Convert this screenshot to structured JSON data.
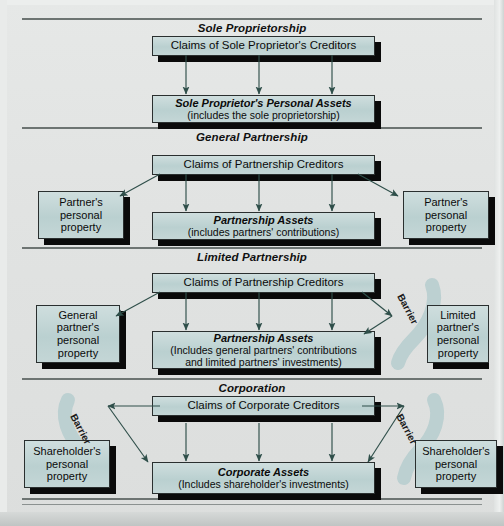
{
  "figure": {
    "title_style": "bold-italic",
    "colors": {
      "box_fill": "#bfd2d2",
      "box_border": "#2a2f2f",
      "shadow": "#0a0a0a",
      "rule": "#6d7472",
      "arrow": "#2f4f4a",
      "barrier_fill": "#b9cfd0",
      "page_background": "#e2e4e3"
    }
  },
  "sections": [
    {
      "id": "sole-proprietorship",
      "title": "Sole Proprietorship",
      "top_box": "Claims of Sole Proprietor's Creditors",
      "bottom_box": {
        "line1": "Sole Proprietor's Personal Assets",
        "line2": "(includes the sole proprietorship)"
      },
      "arrow_count": 3,
      "side_boxes": [],
      "barriers": []
    },
    {
      "id": "general-partnership",
      "title": "General Partnership",
      "top_box": "Claims of Partnership Creditors",
      "bottom_box": {
        "line1": "Partnership Assets",
        "line2": "(includes partners' contributions)"
      },
      "arrow_count": 3,
      "side_boxes": [
        {
          "position": "left",
          "lines": [
            "Partner's",
            "personal",
            "property"
          ]
        },
        {
          "position": "right",
          "lines": [
            "Partner's",
            "personal",
            "property"
          ]
        }
      ],
      "barriers": []
    },
    {
      "id": "limited-partnership",
      "title": "Limited Partnership",
      "top_box": "Claims of Partnership Creditors",
      "bottom_box": {
        "line1": "Partnership Assets",
        "line2": "(Includes general partners' contributions",
        "line3": "and limited partners' investments)"
      },
      "arrow_count": 3,
      "side_boxes": [
        {
          "position": "left",
          "lines": [
            "General",
            "partner's",
            "personal",
            "property"
          ]
        },
        {
          "position": "right",
          "lines": [
            "Limited",
            "partner's",
            "personal",
            "property"
          ]
        }
      ],
      "barriers": [
        {
          "position": "right",
          "label": "Barrier"
        }
      ]
    },
    {
      "id": "corporation",
      "title": "Corporation",
      "top_box": "Claims of Corporate Creditors",
      "bottom_box": {
        "line1": "Corporate Assets",
        "line2": "(Includes shareholder's investments)"
      },
      "arrow_count": 3,
      "side_boxes": [
        {
          "position": "left",
          "lines": [
            "Shareholder's",
            "personal",
            "property"
          ]
        },
        {
          "position": "right",
          "lines": [
            "Shareholder's",
            "personal",
            "property"
          ]
        }
      ],
      "barriers": [
        {
          "position": "left",
          "label": "Barrier"
        },
        {
          "position": "right",
          "label": "Barrier"
        }
      ]
    }
  ]
}
